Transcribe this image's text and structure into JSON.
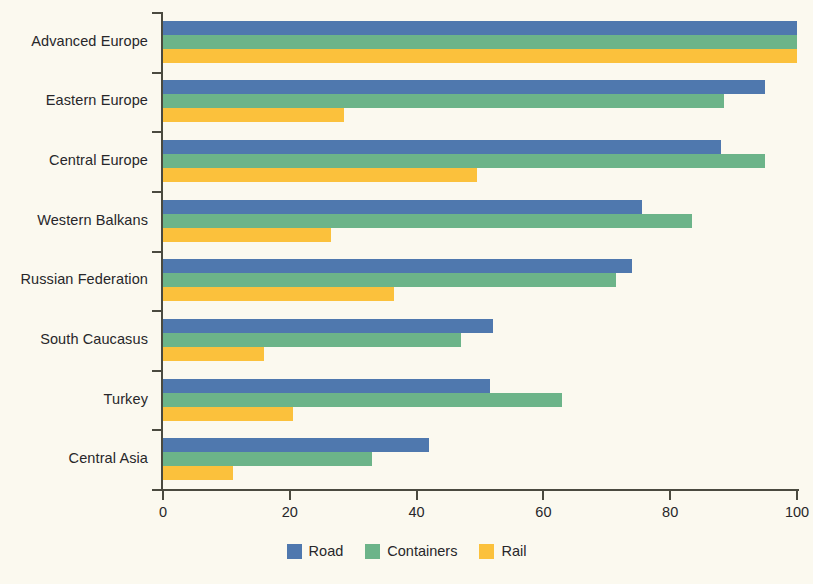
{
  "chart_data": {
    "type": "bar",
    "orientation": "horizontal",
    "title": "",
    "subtitle": "",
    "xlabel": "",
    "ylabel": "",
    "xlim": [
      0,
      100
    ],
    "xticks": [
      0,
      20,
      40,
      60,
      80,
      100
    ],
    "xtick_labels": [
      "0",
      "20",
      "40",
      "60",
      "80",
      "100"
    ],
    "grid": false,
    "legend_position": "bottom-center",
    "categories": [
      "Advanced Europe",
      "Eastern Europe",
      "Central Europe",
      "Western Balkans",
      "Russian Federation",
      "South Caucasus",
      "Turkey",
      "Central Asia"
    ],
    "series": [
      {
        "name": "Road",
        "color": "#4f78ae",
        "values": [
          100,
          95,
          88,
          75.5,
          74,
          52,
          51.5,
          42
        ]
      },
      {
        "name": "Containers",
        "color": "#6cb489",
        "values": [
          100,
          88.5,
          95,
          83.5,
          71.5,
          47,
          63,
          33
        ]
      },
      {
        "name": "Rail",
        "color": "#fbc13c",
        "values": [
          100,
          28.5,
          49.5,
          26.5,
          36.5,
          16,
          20.5,
          11
        ]
      }
    ]
  },
  "colors": {
    "background": "#fbf9ef",
    "axis": "#4a4a3f",
    "text": "#27272a",
    "road": "#4f78ae",
    "containers": "#6cb489",
    "rail": "#fbc13c"
  }
}
